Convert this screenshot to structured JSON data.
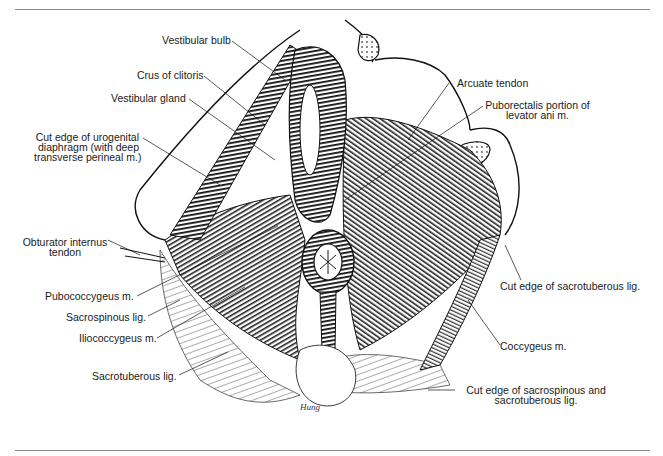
{
  "figure": {
    "labels": {
      "vestibular_bulb": "Vestibular bulb",
      "crus_of_clitoris": "Crus of clitoris",
      "vestibular_gland": "Vestibular gland",
      "cut_edge_urogenital": [
        "Cut edge of urogenital",
        "diaphragm (with deep",
        "transverse perineal m.)"
      ],
      "obturator_internus": [
        "Obturator internus",
        "tendon"
      ],
      "pubococcygeus": "Pubococcygeus m.",
      "sacrospinous": "Sacrospinous lig.",
      "iliococcygeus": "Iliococcygeus m.",
      "sacrotuberous": "Sacrotuberous lig.",
      "arcuate_tendon": "Arcuate tendon",
      "puborectalis": [
        "Puborectalis portion of",
        "levator ani m."
      ],
      "cut_edge_sacrotuberous": "Cut edge of sacrotuberous lig.",
      "coccygeus": "Coccygeus m.",
      "cut_edge_sacrospinous": [
        "Cut edge of sacrospinous and",
        "sacrotuberous lig."
      ]
    },
    "signature": "Hung"
  }
}
